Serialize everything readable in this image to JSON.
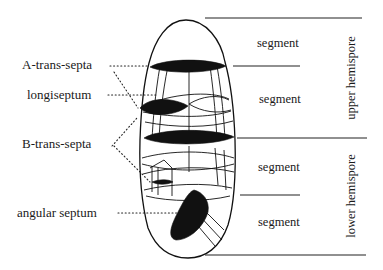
{
  "figure": {
    "left_labels": {
      "a_trans_septa": "A-trans-septa",
      "longiseptum": "longiseptum",
      "b_trans_septa": "B-trans-septa",
      "angular_septum": "angular septum"
    },
    "segments": [
      "segment",
      "segment",
      "segment",
      "segment"
    ],
    "hemispores": {
      "upper": "upper hemispore",
      "lower": "lower hemispore"
    }
  }
}
